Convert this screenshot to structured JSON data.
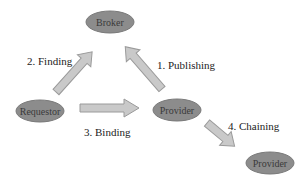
{
  "diagram": {
    "colors": {
      "node_fill": "#8c8c8c",
      "node_stroke": "#7a7a7a",
      "node_text": "#3a3a3a",
      "arrow_fill": "#c9c9c9",
      "arrow_stroke": "#9a9a9a",
      "label_text": "#222222"
    },
    "nodes": [
      {
        "id": "broker",
        "label": "Broker"
      },
      {
        "id": "requestor",
        "label": "Requestor"
      },
      {
        "id": "provider",
        "label": "Provider"
      },
      {
        "id": "provider2",
        "label": "Provider"
      }
    ],
    "edges": [
      {
        "id": "publishing",
        "from": "provider",
        "to": "broker",
        "label": "1. Publishing"
      },
      {
        "id": "finding",
        "from": "requestor",
        "to": "broker",
        "label": "2. Finding"
      },
      {
        "id": "binding",
        "from": "requestor",
        "to": "provider",
        "label": "3. Binding"
      },
      {
        "id": "chaining",
        "from": "provider",
        "to": "provider2",
        "label": "4. Chaining"
      }
    ]
  }
}
